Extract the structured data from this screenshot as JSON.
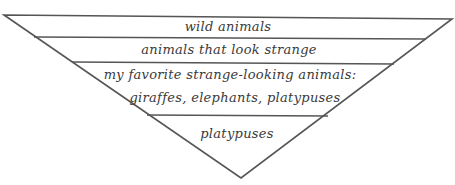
{
  "diagram": {
    "type": "inverted-triangle",
    "line_color": "#555555",
    "text_color": "#3a3a3a",
    "levels": [
      {
        "label": "wild animals"
      },
      {
        "label": "animals that look strange"
      },
      {
        "label_line1": "my favorite strange-looking animals:",
        "label_line2": "giraffes, elephants, platypuses"
      },
      {
        "label": "platypuses"
      }
    ]
  }
}
